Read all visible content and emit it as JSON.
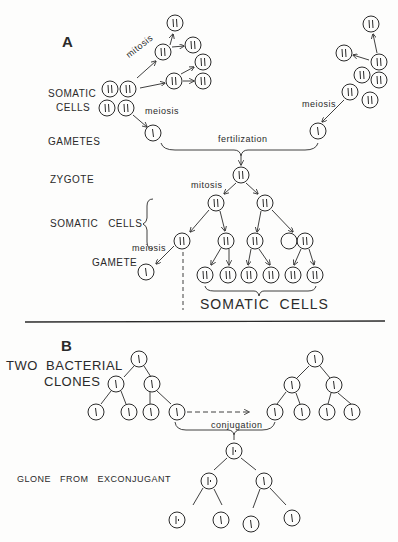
{
  "panel_a": {
    "label": "A",
    "somatic_cells_line1": "SOMATIC",
    "somatic_cells_line2": "CELLS",
    "gametes": "GAMETES",
    "zygote": "ZYGOTE",
    "somatic_cells_mid": "SOMATIC   CELLS",
    "gamete": "GAMETE",
    "somatic_cells_bottom": "SOMATIC  CELLS",
    "mitosis_top": "mitosis",
    "meiosis_left": "meiosis",
    "meiosis_right": "meiosis",
    "fertilization": "fertilization",
    "mitosis_zygote": "mitosis",
    "meiosis_bottom": "meiosis",
    "diploid_symbol": "||",
    "haploid_symbol": "|"
  },
  "panel_b": {
    "label": "B",
    "two_bacterial_clones_line1": "TWO  BACTERIAL",
    "two_bacterial_clones_line2": "CLONES",
    "conjugation": "conjugation",
    "clone_from_exconjugant": "GLONE   FROM   EXCONJUGANT"
  },
  "colors": {
    "ink": "#2a2a2a",
    "background": "#fdfdfc"
  }
}
